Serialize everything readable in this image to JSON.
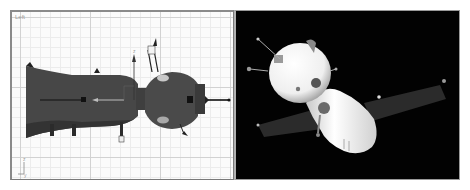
{
  "viewports": [
    {
      "id": "left",
      "label": "Left",
      "background": "#fbfbfb",
      "grid_color": "#d2d2d2",
      "model_color": "#4a4a4a",
      "axis_tripod": {
        "up_label": "z",
        "side_label": "y"
      },
      "gizmo": {
        "x_axis_label": "",
        "y_axis_label": "z"
      }
    },
    {
      "id": "perspective",
      "label": "",
      "background": "#020202",
      "model_color": "#f2f2f2",
      "panel_color": "#2b2b2b"
    }
  ]
}
